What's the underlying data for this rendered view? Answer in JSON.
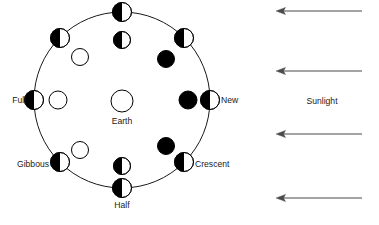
{
  "figure": {
    "background_color": "#ffffff",
    "ink_color": "#000000",
    "arrow_color": "#4a4a4a"
  },
  "labels": {
    "earth": "Earth",
    "full": "Full",
    "new": "New",
    "gibbous": "Gibbous",
    "crescent": "Crescent",
    "half": "Half",
    "sunlight": "Sunlight"
  },
  "earth": {
    "label": "Earth",
    "cx": 122,
    "cy": 101,
    "r": 11,
    "fill": "#ffffff",
    "stroke": "#000000"
  },
  "orbit": {
    "cx": 122,
    "cy": 100,
    "r": 88,
    "stroke": "#000000",
    "stroke_width": 0.9,
    "direction": "counterclockwise",
    "direction_marker_angle_deg": 315
  },
  "orbit_moons": [
    {
      "name": "moon-top",
      "cx": 122,
      "cy": 12,
      "r": 9.5,
      "dark_side": "left",
      "label": ""
    },
    {
      "name": "moon-upper-right",
      "cx": 184,
      "cy": 38,
      "r": 9.5,
      "dark_side": "left",
      "label": ""
    },
    {
      "name": "moon-right-new",
      "cx": 210,
      "cy": 100,
      "r": 9.5,
      "dark_side": "left",
      "label": "New"
    },
    {
      "name": "moon-lower-right",
      "cx": 184,
      "cy": 162,
      "r": 9.5,
      "dark_side": "left",
      "label": "Crescent"
    },
    {
      "name": "moon-bottom",
      "cx": 122,
      "cy": 188,
      "r": 9.5,
      "dark_side": "left",
      "label": "Half"
    },
    {
      "name": "moon-lower-left",
      "cx": 60,
      "cy": 162,
      "r": 9.5,
      "dark_side": "left",
      "label": "Gibbous"
    },
    {
      "name": "moon-left-full",
      "cx": 34,
      "cy": 100,
      "r": 9.5,
      "dark_side": "left",
      "label": "Full"
    },
    {
      "name": "moon-upper-left",
      "cx": 60,
      "cy": 38,
      "r": 9.5,
      "dark_side": "left",
      "label": ""
    }
  ],
  "inner_moons": [
    {
      "name": "view-top",
      "cx": 122,
      "cy": 40,
      "r": 8.5,
      "appearance": "dark-left-light-right"
    },
    {
      "name": "view-upper-right",
      "cx": 166,
      "cy": 59,
      "r": 8.5,
      "appearance": "full-dark"
    },
    {
      "name": "view-right",
      "cx": 188,
      "cy": 100,
      "r": 9.0,
      "appearance": "full-dark"
    },
    {
      "name": "view-lower-right",
      "cx": 166,
      "cy": 146,
      "r": 8.5,
      "appearance": "full-dark"
    },
    {
      "name": "view-bottom",
      "cx": 122,
      "cy": 166,
      "r": 8.5,
      "appearance": "dark-left-light-right"
    },
    {
      "name": "view-lower-left",
      "cx": 80,
      "cy": 150,
      "r": 8.5,
      "appearance": "full-light"
    },
    {
      "name": "view-left",
      "cx": 58,
      "cy": 100,
      "r": 9.0,
      "appearance": "full-light"
    },
    {
      "name": "view-upper-left",
      "cx": 80,
      "cy": 57,
      "r": 8.5,
      "appearance": "full-light"
    }
  ],
  "moon_labels": [
    {
      "name": "label-full",
      "text": "Full",
      "x": 26,
      "y": 103,
      "anchor": "end"
    },
    {
      "name": "label-new",
      "text": "New",
      "x": 221,
      "y": 103,
      "anchor": "start"
    },
    {
      "name": "label-gibbous",
      "text": "Gibbous",
      "x": 49,
      "y": 167,
      "anchor": "end"
    },
    {
      "name": "label-crescent",
      "text": "Crescent",
      "x": 195,
      "y": 167,
      "anchor": "start"
    },
    {
      "name": "label-half",
      "text": "Half",
      "x": 122,
      "y": 208,
      "anchor": "middle"
    },
    {
      "name": "label-earth",
      "text": "Earth",
      "x": 122,
      "y": 124,
      "anchor": "middle"
    }
  ],
  "sunlight": {
    "label": "Sunlight",
    "label_x": 322,
    "label_y": 104,
    "arrow_direction": "left",
    "arrows": [
      {
        "name": "sunlight-arrow-1",
        "y": 11,
        "x_tail": 362,
        "x_head": 276
      },
      {
        "name": "sunlight-arrow-2",
        "y": 71,
        "x_tail": 362,
        "x_head": 276
      },
      {
        "name": "sunlight-arrow-3",
        "y": 134,
        "x_tail": 362,
        "x_head": 276
      },
      {
        "name": "sunlight-arrow-4",
        "y": 198,
        "x_tail": 362,
        "x_head": 276
      }
    ]
  }
}
